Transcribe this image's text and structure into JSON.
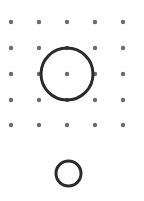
{
  "canvas": {
    "width": 144,
    "height": 201,
    "background_color": "#ffffff"
  },
  "dot_grid": {
    "name": "dot-grid",
    "rows": 5,
    "columns": 5,
    "dot_color": "#6b6b6b",
    "dot_radius": 2.2,
    "x_positions": [
      11,
      39,
      67,
      95,
      123
    ],
    "y_positions": [
      22,
      48,
      74,
      100,
      125
    ],
    "x_spacing": 28,
    "y_spacing": 26
  },
  "shapes": [
    {
      "name": "large-circle",
      "type": "circle",
      "cx": 67,
      "cy": 74,
      "r": 26,
      "stroke_color": "#2b2b2b",
      "stroke_width": 3,
      "fill": "none",
      "note": "centered on center dot of grid, passes through four adjacent dots"
    },
    {
      "name": "small-circle",
      "type": "circle",
      "cx": 68.5,
      "cy": 173.5,
      "r": 12.5,
      "stroke_color": "#2b2b2b",
      "stroke_width": 3,
      "fill": "none",
      "note": "positioned below the dot grid"
    }
  ],
  "colors": {
    "dot": "#6b6b6b",
    "stroke": "#2b2b2b",
    "background": "#ffffff"
  }
}
